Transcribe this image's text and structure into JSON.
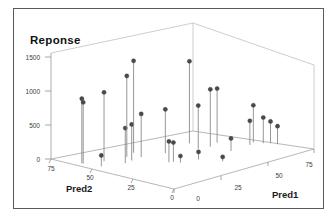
{
  "chart_data": {
    "type": "scatter",
    "title": "Reponse",
    "subtitle": "",
    "projection": "3d-stem-scatter",
    "xlabel": "Pred1",
    "ylabel": "Pred2",
    "zlabel": "Reponse",
    "grid": false,
    "legend": null,
    "x_ticks": [
      "0",
      "25",
      "50",
      "75"
    ],
    "x_tick_values": [
      0,
      25,
      50,
      75
    ],
    "y_ticks": [
      "75",
      "50",
      "25",
      "0"
    ],
    "y_tick_values": [
      75,
      50,
      25,
      0
    ],
    "z_ticks": [
      "0",
      "500",
      "1000",
      "1500"
    ],
    "z_tick_values": [
      0,
      500,
      1000,
      1500
    ],
    "xlim": [
      0,
      90
    ],
    "ylim": [
      0,
      90
    ],
    "zlim": [
      0,
      1700
    ],
    "points": [
      {
        "x": 4,
        "y": 72,
        "z": 1180
      },
      {
        "x": 4,
        "y": 71,
        "z": 1120
      },
      {
        "x": 6,
        "y": 60,
        "z": 200
      },
      {
        "x": 13,
        "y": 66,
        "z": 1260
      },
      {
        "x": 17,
        "y": 55,
        "z": 640
      },
      {
        "x": 22,
        "y": 56,
        "z": 660
      },
      {
        "x": 25,
        "y": 63,
        "z": 1480
      },
      {
        "x": 29,
        "y": 57,
        "z": 790
      },
      {
        "x": 32,
        "y": 66,
        "z": 1680
      },
      {
        "x": 31,
        "y": 39,
        "z": 380
      },
      {
        "x": 33,
        "y": 38,
        "z": 350
      },
      {
        "x": 34,
        "y": 34,
        "z": 120
      },
      {
        "x": 41,
        "y": 53,
        "z": 800
      },
      {
        "x": 43,
        "y": 31,
        "z": 140
      },
      {
        "x": 48,
        "y": 19,
        "z": 80
      },
      {
        "x": 56,
        "y": 46,
        "z": 790
      },
      {
        "x": 60,
        "y": 57,
        "z": 1500
      },
      {
        "x": 62,
        "y": 44,
        "z": 1050
      },
      {
        "x": 63,
        "y": 30,
        "z": 230
      },
      {
        "x": 69,
        "y": 47,
        "z": 990
      },
      {
        "x": 76,
        "y": 31,
        "z": 440
      },
      {
        "x": 80,
        "y": 33,
        "z": 680
      },
      {
        "x": 82,
        "y": 28,
        "z": 470
      },
      {
        "x": 84,
        "y": 25,
        "z": 400
      },
      {
        "x": 85,
        "y": 21,
        "z": 330
      }
    ]
  },
  "figure": {
    "title": "Reponse",
    "x_axis_title": "Pred1",
    "y_axis_title": "Pred2",
    "tick_labels_z": [
      "1500",
      "1000",
      "500",
      "0"
    ],
    "tick_labels_y": [
      "75",
      "50",
      "25",
      "0"
    ],
    "tick_labels_x": [
      "0",
      "25",
      "50",
      "75"
    ]
  },
  "colors": {
    "marker": "#4a4a4a",
    "stem": "#8a8a8a",
    "axis": "#9a9a9a",
    "box": "#b8b8b8",
    "frame": "#5a5a5a",
    "text": "#1a1a1a",
    "background": "#ffffff"
  }
}
